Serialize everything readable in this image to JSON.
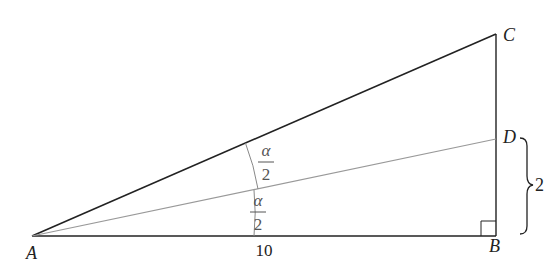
{
  "diagram": {
    "points": {
      "A": {
        "label": "A",
        "x": 32,
        "y": 236
      },
      "B": {
        "label": "B",
        "x": 496,
        "y": 236
      },
      "C": {
        "label": "C",
        "x": 496,
        "y": 34
      },
      "D": {
        "label": "D",
        "x": 496,
        "y": 139
      }
    },
    "segments": [
      {
        "from": "A",
        "to": "B",
        "label": "10"
      },
      {
        "from": "B",
        "to": "C"
      },
      {
        "from": "A",
        "to": "C"
      },
      {
        "from": "A",
        "to": "D"
      }
    ],
    "angles": {
      "upper": {
        "numerator": "α",
        "denominator": "2"
      },
      "lower": {
        "numerator": "α",
        "denominator": "2"
      }
    },
    "right_angle_at": "B",
    "brace": {
      "span": "D to B",
      "label": "2"
    },
    "colors": {
      "main_line": "#222222",
      "bisector_line": "#999999",
      "arc_line": "#888888"
    }
  }
}
